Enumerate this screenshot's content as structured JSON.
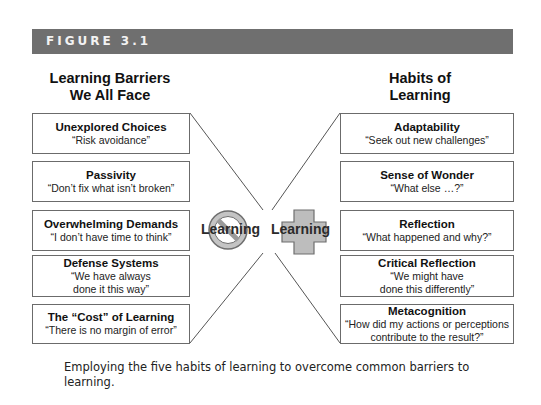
{
  "figure": {
    "label": "FIGURE 3.1",
    "banner_color": "#6f6f6f"
  },
  "left_column": {
    "heading_line1": "Learning Barriers",
    "heading_line2": "We All Face",
    "items": [
      {
        "title": "Unexplored Choices",
        "quote": "“Risk avoidance”"
      },
      {
        "title": "Passivity",
        "quote": "“Don’t fix what isn’t broken”"
      },
      {
        "title": "Overwhelming Demands",
        "quote": "“I don’t have time to think”"
      },
      {
        "title": "Defense Systems",
        "quote": "“We have always\ndone it this way”"
      },
      {
        "title": "The “Cost” of Learning",
        "quote": "“There is no margin of error”"
      }
    ]
  },
  "right_column": {
    "heading_line1": "Habits of",
    "heading_line2": "Learning",
    "items": [
      {
        "title": "Adaptability",
        "quote": "“Seek out new challenges”"
      },
      {
        "title": "Sense of Wonder",
        "quote": "“What else …?”"
      },
      {
        "title": "Reflection",
        "quote": "“What happened and why?”"
      },
      {
        "title": "Critical Reflection",
        "quote": "“We might have\ndone this differently”"
      },
      {
        "title": "Metacognition",
        "quote": "“How did my actions or perceptions\ncontribute to the result?”"
      }
    ]
  },
  "center": {
    "no_learning_label": "Learning",
    "no_learning_icon": "prohibition-sign-icon",
    "plus_learning_label": "Learning",
    "plus_learning_icon": "plus-cross-icon",
    "icon_fill": "#bdbdbd",
    "icon_stroke": "#7a7a7a"
  },
  "caption": "Employing the five habits of learning to overcome common barriers to learning."
}
